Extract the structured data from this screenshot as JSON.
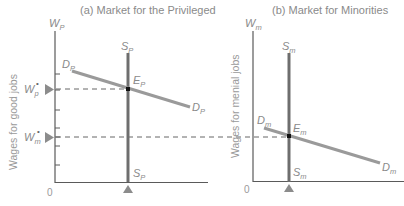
{
  "panels": [
    {
      "title": "(a) Market for the Privileged",
      "y_axis": {
        "symbol": "W",
        "sub": "P",
        "label": "Wages for good jobs"
      },
      "origin": "0",
      "supply": {
        "symbol": "S",
        "sub": "P"
      },
      "demand": {
        "symbol": "D",
        "sub": "P"
      },
      "equilibrium": {
        "symbol": "E",
        "sub": "P"
      },
      "wage_markers": [
        {
          "symbol": "W",
          "sub": "p",
          "star": "•"
        },
        {
          "symbol": "W",
          "sub": "m",
          "star": "•"
        }
      ]
    },
    {
      "title": "(b) Market for Minorities",
      "y_axis": {
        "symbol": "W",
        "sub": "m",
        "label": "Wages for menial jobs"
      },
      "origin": "0",
      "supply": {
        "symbol": "S",
        "sub": "m"
      },
      "demand": {
        "symbol": "D",
        "sub": "m"
      },
      "equilibrium": {
        "symbol": "E",
        "sub": "m"
      }
    }
  ],
  "colors": {
    "axis": "#5a5a5a",
    "supply": "#6e6e6e",
    "demand": "#9a9a9a",
    "text": "#8a8a8a",
    "marker": "#8c8c8c"
  }
}
